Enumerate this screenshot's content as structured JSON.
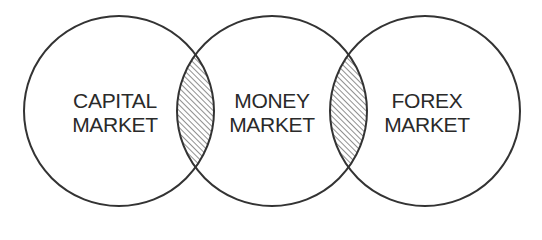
{
  "diagram": {
    "type": "venn",
    "stroke_color": "#333333",
    "hatch_color": "#444444",
    "background": "#ffffff",
    "circles": [
      {
        "id": "capital",
        "cx": 119,
        "cy": 111,
        "r": 95,
        "label_line1": "CAPITAL",
        "label_line2": "MARKET"
      },
      {
        "id": "money",
        "cx": 272,
        "cy": 111,
        "r": 95,
        "label_line1": "MONEY",
        "label_line2": "MARKET"
      },
      {
        "id": "forex",
        "cx": 425,
        "cy": 111,
        "r": 95,
        "label_line1": "FOREX",
        "label_line2": "MARKET"
      }
    ],
    "overlaps": [
      {
        "between": [
          "capital",
          "money"
        ],
        "fill": "hatched"
      },
      {
        "between": [
          "money",
          "forex"
        ],
        "fill": "hatched"
      }
    ]
  }
}
